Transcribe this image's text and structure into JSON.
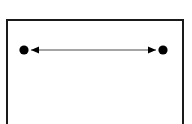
{
  "figure": {
    "type": "line-diagram",
    "background_color": "#ffffff",
    "ink_color": "#000000",
    "canvas": {
      "width": 192,
      "height": 124
    },
    "frame": {
      "name": "rectangular-border",
      "stroke_color": "#1a1a1a",
      "stroke_width": 2,
      "x": 7,
      "y": 20,
      "width": 176,
      "height": 112,
      "bottom_clipped": true
    },
    "endpoints": [
      {
        "name": "left-endpoint-dot",
        "shape": "filled-circle",
        "cx": 24,
        "cy": 50,
        "r": 4.6,
        "fill": "#000000"
      },
      {
        "name": "right-endpoint-dot",
        "shape": "filled-circle",
        "cx": 163,
        "cy": 50,
        "r": 4.6,
        "fill": "#000000"
      }
    ],
    "arrow": {
      "name": "double-headed-arrow",
      "y": 50,
      "x_start": 31,
      "x_end": 156,
      "stroke_color": "#4a4a4a",
      "stroke_width": 1,
      "head_length": 8,
      "head_half_width": 3.6,
      "head_fill": "#000000",
      "heads": [
        "left",
        "right"
      ]
    },
    "labels": []
  }
}
